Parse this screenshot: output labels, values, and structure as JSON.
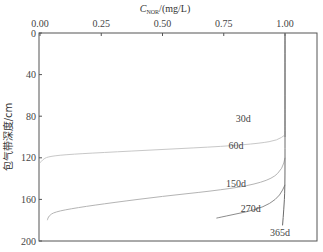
{
  "chart_data": {
    "type": "line",
    "title": "",
    "xlabel": "C_NOR/(mg/L)",
    "xlabel_main": "C",
    "xlabel_sub": "NOR",
    "xlabel_unit": "/(mg/L)",
    "ylabel": "包气带深度/cm",
    "xlim": [
      0,
      1.08
    ],
    "ylim": [
      200,
      0
    ],
    "x_axis_position": "top",
    "y_inverted": true,
    "grid": false,
    "x_ticks": [
      "0.00",
      "0.25",
      "0.50",
      "0.75",
      "1.00"
    ],
    "y_ticks": [
      "0",
      "40",
      "80",
      "120",
      "160",
      "200"
    ],
    "series": [
      {
        "name": "30d",
        "label_pos": [
          0.83,
          86
        ],
        "points": [
          [
            1.0,
            0
          ],
          [
            1.0,
            40
          ],
          [
            1.0,
            80
          ],
          [
            1.0,
            100
          ]
        ]
      },
      {
        "name": "60d",
        "label_pos": [
          0.8,
          112
        ],
        "points": [
          [
            0.0,
            125
          ],
          [
            0.01,
            122
          ],
          [
            0.03,
            119
          ],
          [
            0.1,
            117
          ],
          [
            0.25,
            115
          ],
          [
            0.5,
            112
          ],
          [
            0.75,
            109
          ],
          [
            0.9,
            106
          ],
          [
            0.97,
            103
          ],
          [
            1.0,
            98
          ]
        ]
      },
      {
        "name": "150d",
        "label_pos": [
          0.8,
          148
        ],
        "points": [
          [
            0.03,
            180
          ],
          [
            0.035,
            176
          ],
          [
            0.06,
            172
          ],
          [
            0.15,
            168
          ],
          [
            0.3,
            163
          ],
          [
            0.5,
            157
          ],
          [
            0.7,
            152
          ],
          [
            0.85,
            147
          ],
          [
            0.95,
            140
          ],
          [
            0.99,
            130
          ],
          [
            1.0,
            120
          ]
        ]
      },
      {
        "name": "270d",
        "label_pos": [
          0.86,
          172
        ],
        "points": [
          [
            0.72,
            178
          ],
          [
            0.8,
            174
          ],
          [
            0.88,
            170
          ],
          [
            0.94,
            164
          ],
          [
            0.98,
            156
          ],
          [
            1.0,
            146
          ]
        ]
      },
      {
        "name": "365d",
        "label_pos": [
          0.98,
          195
        ],
        "points": [
          [
            1.0,
            0
          ],
          [
            1.0,
            100
          ],
          [
            1.0,
            150
          ],
          [
            0.995,
            170
          ],
          [
            0.99,
            185
          ]
        ]
      }
    ],
    "colors": {
      "30d": "#8a8a8a",
      "60d": "#c8c8c8",
      "150d": "#b4b4b4",
      "270d": "#8c8c8c",
      "365d": "#6a6a6a",
      "axis": "#555555"
    }
  }
}
